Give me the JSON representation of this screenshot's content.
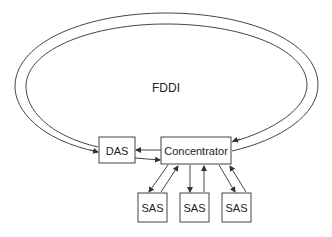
{
  "diagram": {
    "ring_label": "FDDI",
    "nodes": {
      "das": "DAS",
      "concentrator": "Concentrator",
      "sas": [
        "SAS",
        "SAS",
        "SAS"
      ]
    },
    "colors": {
      "stroke": "#333333",
      "background": "#ffffff"
    }
  }
}
